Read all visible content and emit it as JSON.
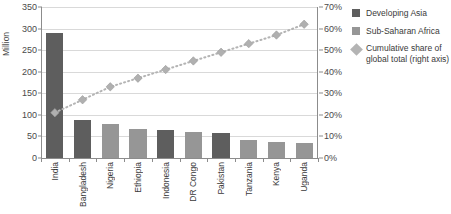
{
  "chart_data": {
    "type": "bar",
    "title": "",
    "subtitle": "",
    "categories": [
      "India",
      "Bangladesh",
      "Nigeria",
      "Ethiopia",
      "Indonesia",
      "DR Congo",
      "Pakistan",
      "Tanzania",
      "Kenya",
      "Uganda"
    ],
    "series": [
      {
        "name": "Developing Asia",
        "color": "#5e5e5e",
        "axis": "left",
        "values": [
          290,
          88,
          null,
          null,
          64,
          null,
          59,
          null,
          null,
          null
        ]
      },
      {
        "name": "Sub-Saharan Africa",
        "color": "#969696",
        "axis": "left",
        "values": [
          null,
          null,
          78,
          67,
          null,
          60,
          null,
          42,
          38,
          35
        ]
      },
      {
        "name": "Cumulative share of global total (right axis)",
        "color": "#b4b4b4",
        "axis": "right",
        "type": "line",
        "marker": "diamond",
        "values": [
          21,
          27,
          33,
          37,
          41,
          45,
          49,
          53,
          57,
          62
        ]
      }
    ],
    "bar_values": [
      290,
      88,
      78,
      67,
      64,
      60,
      59,
      42,
      38,
      35
    ],
    "bar_groups": [
      "Developing Asia",
      "Developing Asia",
      "Sub-Saharan Africa",
      "Sub-Saharan Africa",
      "Developing Asia",
      "Sub-Saharan Africa",
      "Developing Asia",
      "Sub-Saharan Africa",
      "Sub-Saharan Africa",
      "Sub-Saharan Africa"
    ],
    "cumulative_values": [
      21,
      27,
      33,
      37,
      41,
      45,
      49,
      53,
      57,
      62
    ],
    "xlabel": "",
    "ylabel": "Million",
    "ylabel_right": "",
    "ylim": [
      0,
      350
    ],
    "ylim_right": [
      0,
      70
    ],
    "yticks": [
      0,
      50,
      100,
      150,
      200,
      250,
      300,
      350
    ],
    "ytick_labels": [
      "0",
      "50",
      "100",
      "150",
      "200",
      "250",
      "300",
      "350"
    ],
    "yticks_right": [
      0,
      10,
      20,
      30,
      40,
      50,
      60,
      70
    ],
    "ytick_labels_right": [
      "0%",
      "10%",
      "20%",
      "30%",
      "40%",
      "50%",
      "60%",
      "70%"
    ],
    "grid": true,
    "grid_axis": "y",
    "legend_position": "right"
  },
  "axes": {
    "left_title": "Million"
  },
  "legend": {
    "items": [
      {
        "label": "Developing Asia",
        "swatch": "square",
        "color": "#5e5e5e"
      },
      {
        "label": "Sub-Saharan Africa",
        "swatch": "square",
        "color": "#969696"
      },
      {
        "label": "Cumulative share of global total (right axis)",
        "swatch": "diamond",
        "color": "#b4b4b4"
      }
    ]
  }
}
